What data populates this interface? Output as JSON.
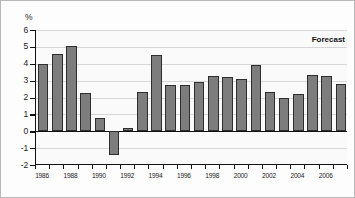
{
  "chart_data": {
    "type": "bar",
    "title": "",
    "subtitle": "",
    "xlabel": "",
    "ylabel": "%",
    "ylim": [
      -2,
      6
    ],
    "ytick_values": [
      6,
      5,
      4,
      3,
      2,
      1,
      0,
      -1,
      -2
    ],
    "ytick_labels": [
      "6",
      "5",
      "4",
      "3",
      "2",
      "1",
      "0",
      "-1",
      "-2"
    ],
    "grid": true,
    "legend": "none",
    "annotations": [
      {
        "text": "Forecast",
        "position": "top-right"
      }
    ],
    "xtick_labels": [
      "1986",
      "1988",
      "1990",
      "1992",
      "1994",
      "1996",
      "1998",
      "2000",
      "2002",
      "2004",
      "2006"
    ],
    "categories": [
      "1986",
      "1987",
      "1988",
      "1989",
      "1990",
      "1991",
      "1992",
      "1993",
      "1994",
      "1995",
      "1996",
      "1997",
      "1998",
      "1999",
      "2000",
      "2001",
      "2002",
      "2003",
      "2004",
      "2005",
      "2006",
      "2007"
    ],
    "values": [
      4.0,
      4.6,
      5.05,
      2.25,
      0.8,
      -1.4,
      0.2,
      2.35,
      4.5,
      2.75,
      2.75,
      2.9,
      3.3,
      3.2,
      3.1,
      3.9,
      2.35,
      1.95,
      2.2,
      3.35,
      3.3,
      2.8
    ],
    "series_color": "#7d7d7d",
    "series_border_color": "#2e2e2e",
    "grid_color": "#d6d6d6",
    "axis_color": "#111111",
    "background_color": "#fafafa",
    "forecast_start_category": "2006"
  }
}
